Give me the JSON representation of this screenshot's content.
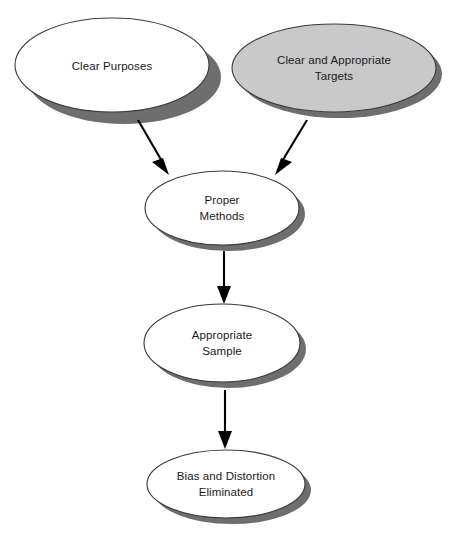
{
  "diagram": {
    "background_color": "#ffffff",
    "palette": {
      "oval_fill_default": "#ffffff",
      "oval_fill_highlight": "#c9c9c9",
      "oval_stroke": "#3a3a3a",
      "shadow": "#6e6e6e",
      "arrow": "#000000",
      "text": "#1a1a1a"
    },
    "nodes": [
      {
        "id": "clear-purposes",
        "label_lines": [
          "Clear Purposes"
        ],
        "line1": "Clear Purposes",
        "line2": "",
        "shape": "ellipse",
        "fill": "#ffffff",
        "cx": 112,
        "cy": 65,
        "rx": 97,
        "ry": 47
      },
      {
        "id": "clear-and-appropriate-targets",
        "label_lines": [
          "Clear and Appropriate",
          "Targets"
        ],
        "line1": "Clear and Appropriate",
        "line2": "Targets",
        "shape": "ellipse",
        "fill": "#c9c9c9",
        "cx": 334,
        "cy": 68,
        "rx": 102,
        "ry": 44
      },
      {
        "id": "proper-methods",
        "label_lines": [
          "Proper",
          "Methods"
        ],
        "line1": "Proper",
        "line2": "Methods",
        "shape": "ellipse",
        "fill": "#ffffff",
        "cx": 222,
        "cy": 208,
        "rx": 77,
        "ry": 37
      },
      {
        "id": "appropriate-sample",
        "label_lines": [
          "Appropriate",
          "Sample"
        ],
        "line1": "Appropriate",
        "line2": "Sample",
        "shape": "ellipse",
        "fill": "#ffffff",
        "cx": 222,
        "cy": 343,
        "rx": 78,
        "ry": 39
      },
      {
        "id": "bias-and-distortion-eliminated",
        "label_lines": [
          "Bias and Distortion",
          "Eliminated"
        ],
        "line1": "Bias and Distortion",
        "line2": "Eliminated",
        "shape": "ellipse",
        "fill": "#ffffff",
        "cx": 226,
        "cy": 484,
        "rx": 79,
        "ry": 34
      }
    ],
    "edges": [
      {
        "id": "edge-clear-purposes-to-proper-methods",
        "from": "clear-purposes",
        "to": "proper-methods",
        "direction": "down-right",
        "x1": 138,
        "y1": 120,
        "x2": 167,
        "y2": 173
      },
      {
        "id": "edge-targets-to-proper-methods",
        "from": "clear-and-appropriate-targets",
        "to": "proper-methods",
        "direction": "down-left",
        "x1": 307,
        "y1": 120,
        "x2": 276,
        "y2": 173
      },
      {
        "id": "edge-proper-methods-to-appropriate-sample",
        "from": "proper-methods",
        "to": "appropriate-sample",
        "direction": "down",
        "x1": 224,
        "y1": 251,
        "x2": 224,
        "y2": 303
      },
      {
        "id": "edge-appropriate-sample-to-bias",
        "from": "appropriate-sample",
        "to": "bias-and-distortion-eliminated",
        "direction": "down",
        "x1": 225,
        "y1": 390,
        "x2": 225,
        "y2": 448
      }
    ]
  }
}
